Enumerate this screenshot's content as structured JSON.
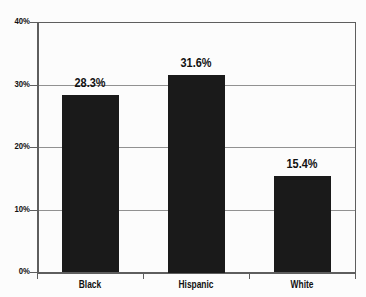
{
  "chart_data": {
    "type": "bar",
    "categories": [
      "Black",
      "Hispanic",
      "White"
    ],
    "values": [
      28.3,
      31.6,
      15.4
    ],
    "value_labels": [
      "28.3%",
      "31.6%",
      "15.4%"
    ],
    "title": "",
    "xlabel": "",
    "ylabel": "",
    "ylim": [
      0,
      40
    ],
    "yticks": [
      0,
      10,
      20,
      30,
      40
    ],
    "ytick_labels": [
      "0%",
      "10%",
      "20%",
      "30%",
      "40%"
    ],
    "grid": "horizontal",
    "legend": "none"
  },
  "style": {
    "background": "#fcfcfc",
    "bar_color": "#1a1a1a",
    "grid_color": "#919191",
    "axis_color": "#5e5e5e",
    "label_color": "#111111"
  }
}
